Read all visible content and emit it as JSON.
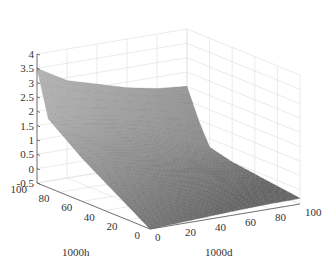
{
  "chart_data": {
    "type": "surface",
    "title": "",
    "xlabel": "1000d",
    "ylabel": "1000h",
    "zlabel": "",
    "x_ticks": [
      "0",
      "20",
      "40",
      "60",
      "80",
      "100"
    ],
    "y_ticks": [
      "0",
      "20",
      "40",
      "60",
      "80",
      "100"
    ],
    "z_ticks": [
      "-0.5",
      "0",
      "0.5",
      "1",
      "1.5",
      "2",
      "2.5",
      "3",
      "3.5",
      "4"
    ],
    "xlim": [
      0,
      100
    ],
    "ylim": [
      0,
      100
    ],
    "zlim": [
      -0.5,
      4
    ],
    "grid": true,
    "colormap": "gray",
    "surface_samples": {
      "description": "Approximate z values on a grid; rows = 1000h, cols = 1000d",
      "d": [
        0,
        20,
        40,
        60,
        80,
        100
      ],
      "h": [
        0,
        20,
        40,
        60,
        80,
        90,
        100
      ],
      "z": [
        [
          -0.5,
          -0.45,
          -0.4,
          -0.35,
          -0.32,
          -0.3
        ],
        [
          0.0,
          0.0,
          -0.05,
          -0.1,
          -0.15,
          -0.2
        ],
        [
          0.5,
          0.45,
          0.35,
          0.2,
          0.05,
          -0.1
        ],
        [
          1.0,
          0.9,
          0.75,
          0.5,
          0.25,
          0.0
        ],
        [
          1.6,
          1.45,
          1.25,
          1.0,
          0.6,
          0.2
        ],
        [
          1.9,
          1.8,
          1.65,
          1.45,
          1.2,
          1.0
        ],
        [
          3.5,
          2.9,
          2.6,
          2.3,
          2.1,
          2.0
        ]
      ]
    }
  }
}
